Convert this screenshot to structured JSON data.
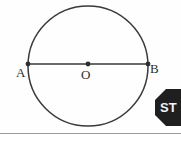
{
  "figure": {
    "background_color": "#fefefe",
    "stroke_color": "#3a3a3a",
    "label_color": "#2e2e2e",
    "circle": {
      "center_x": 88,
      "center_y": 66,
      "radius": 60,
      "stroke_width": 1.5
    },
    "diameter": {
      "y": 64,
      "x_start": 28,
      "x_end": 148,
      "stroke_width": 1.6
    },
    "points": [
      {
        "id": "A",
        "label": "A",
        "x": 28,
        "y": 64,
        "dot_radius": 2.4
      },
      {
        "id": "O",
        "label": "O",
        "x": 88,
        "y": 64,
        "dot_radius": 2.4
      },
      {
        "id": "B",
        "label": "B",
        "x": 148,
        "y": 64,
        "dot_radius": 2.4
      }
    ],
    "labels": {
      "a": "A",
      "o": "O",
      "b": "B"
    }
  },
  "stop_sign": {
    "text": "ST",
    "fill_color": "#1f1f1f",
    "text_color": "#f2f2f2",
    "shape": "octagon",
    "clipped": true
  },
  "rule": {
    "color": "#9a9a9a"
  }
}
